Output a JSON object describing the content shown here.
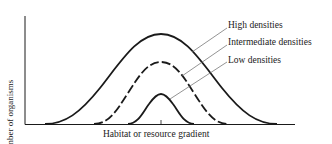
{
  "figure": {
    "y_axis_label": "Number of organisms",
    "x_axis_label": "Habitat or resource gradient",
    "curves": [
      {
        "label": "High densities",
        "style": "solid",
        "relative_height": 1.0,
        "relative_width": "wide"
      },
      {
        "label": "Intermediate densities",
        "style": "dashed",
        "relative_height": 0.68,
        "relative_width": "medium"
      },
      {
        "label": "Low densities",
        "style": "solid",
        "relative_height": 0.33,
        "relative_width": "narrow"
      }
    ],
    "colors": {
      "ink": "#1a1a1a",
      "leader": "#666666",
      "background": "#ffffff"
    }
  }
}
